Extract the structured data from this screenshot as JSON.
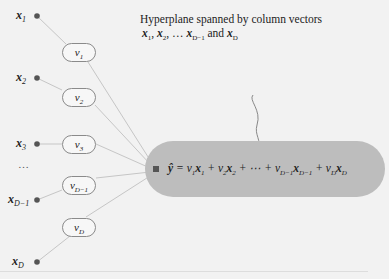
{
  "inputs": [
    {
      "base": "x",
      "sub": "1"
    },
    {
      "base": "x",
      "sub": "2"
    },
    {
      "base": "x",
      "sub": "3"
    },
    {
      "base": "x",
      "sub": "D−1"
    },
    {
      "base": "x",
      "sub": "D"
    }
  ],
  "weights": [
    {
      "base": "v",
      "sub": "1"
    },
    {
      "base": "v",
      "sub": "2"
    },
    {
      "base": "v",
      "sub": "3"
    },
    {
      "base": "v",
      "sub": "D−1"
    },
    {
      "base": "v",
      "sub": "D"
    }
  ],
  "ellipsis": "…",
  "output_equation": {
    "lhs": "ŷ",
    "equals": " = ",
    "terms": [
      "v₁x₁",
      "v₂x₂",
      "⋯",
      "v_{D−1}x_{D−1}",
      "v_Dx_D"
    ]
  },
  "annotation": {
    "line1": "Hyperplane spanned by column vectors",
    "line2_parts": [
      "x",
      "1",
      ", ",
      "x",
      "2",
      ", … ",
      "x",
      "D−1",
      " and ",
      "x",
      "D"
    ]
  },
  "colors": {
    "pill": "#bdbdbd",
    "line": "#c8c8c8",
    "dot": "#555555",
    "oval_border": "#8a8a8a"
  }
}
